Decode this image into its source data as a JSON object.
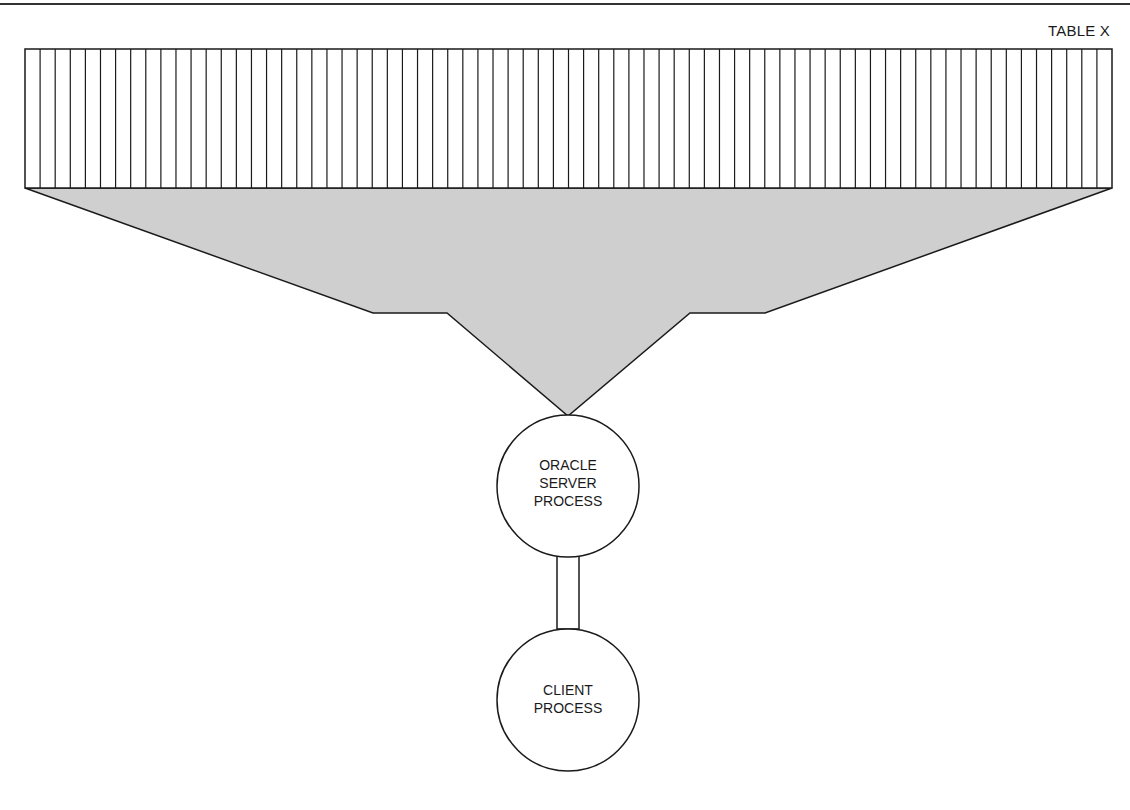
{
  "diagram": {
    "table_label": "TABLE X",
    "table_columns": 72,
    "server_node": {
      "lines": [
        "ORACLE",
        "SERVER",
        "PROCESS"
      ]
    },
    "client_node": {
      "lines": [
        "CLIENT",
        "PROCESS"
      ]
    },
    "colors": {
      "stroke": "#1a1a1a",
      "funnel_fill": "#cfcfcf",
      "background": "#ffffff"
    }
  }
}
